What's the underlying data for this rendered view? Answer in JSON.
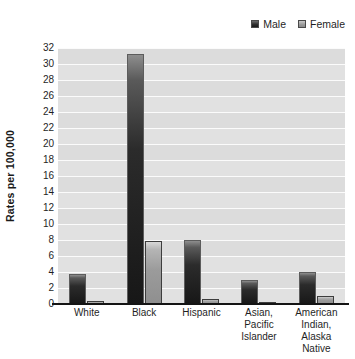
{
  "legend": {
    "position": "top-right",
    "entries": [
      {
        "label": "Male",
        "swatch": "male-swatch",
        "color": "#2b2b2b"
      },
      {
        "label": "Female",
        "swatch": "female-swatch",
        "color": "#9b9b9b"
      }
    ]
  },
  "axes": {
    "ylabel": "Rates per 100,000",
    "yticks": [
      0,
      2,
      4,
      6,
      8,
      10,
      12,
      14,
      16,
      18,
      20,
      22,
      24,
      26,
      28,
      30,
      32
    ]
  },
  "categories_multiline": [
    [
      "White"
    ],
    [
      "Black"
    ],
    [
      "Hispanic"
    ],
    [
      "Asian,",
      "Pacific",
      "Islander"
    ],
    [
      "American",
      "Indian,",
      "Alaska Native"
    ]
  ],
  "chart_data": {
    "type": "bar",
    "title": "",
    "xlabel": "",
    "ylabel": "Rates per 100,000",
    "ylim": [
      0,
      32
    ],
    "ytick_step": 2,
    "grid": true,
    "legend_position": "top-right",
    "categories": [
      "White",
      "Black",
      "Hispanic",
      "Asian, Pacific Islander",
      "American Indian, Alaska Native"
    ],
    "series": [
      {
        "name": "Male",
        "color": "#2b2b2b",
        "values": [
          3.7,
          31.3,
          8.0,
          3.0,
          4.0
        ]
      },
      {
        "name": "Female",
        "color": "#9b9b9b",
        "values": [
          0.4,
          7.9,
          0.6,
          0.2,
          1.0
        ]
      }
    ]
  }
}
